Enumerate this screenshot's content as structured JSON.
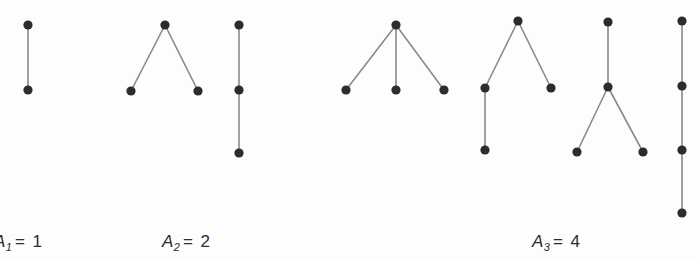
{
  "figure": {
    "background_color": "#fdfdfd",
    "node_color": "#2c2c2c",
    "edge_color": "#8a8a8a",
    "width": 698,
    "height": 259
  },
  "labels": [
    {
      "id": "label-a1",
      "variable": "A",
      "subscript": "1",
      "equals": "=",
      "value": "1",
      "text": "A1 = 1",
      "x": -6,
      "y": 232
    },
    {
      "id": "label-a2",
      "variable": "A",
      "subscript": "2",
      "equals": "=",
      "value": "2",
      "text": "A2 = 2",
      "x": 162,
      "y": 232
    },
    {
      "id": "label-a3",
      "variable": "A",
      "subscript": "3",
      "equals": "=",
      "value": "4",
      "text": "A3 = 4",
      "x": 532,
      "y": 232
    }
  ],
  "graphs": [
    {
      "id": "tree-1-path2",
      "group": "A1",
      "description": "path with 2 nodes",
      "node_count": 2,
      "nodes": [
        {
          "id": "n1",
          "x": 28,
          "y": 25
        },
        {
          "id": "n2",
          "x": 28,
          "y": 90
        }
      ],
      "edges": [
        [
          "n1",
          "n2"
        ]
      ]
    },
    {
      "id": "tree-2-cherry",
      "group": "A2",
      "description": "root with two leaf children",
      "node_count": 3,
      "nodes": [
        {
          "id": "n1",
          "x": 165,
          "y": 25
        },
        {
          "id": "n2",
          "x": 131,
          "y": 91
        },
        {
          "id": "n3",
          "x": 198,
          "y": 91
        }
      ],
      "edges": [
        [
          "n1",
          "n2"
        ],
        [
          "n1",
          "n3"
        ]
      ]
    },
    {
      "id": "tree-3-path3",
      "group": "A2",
      "description": "path with 3 nodes",
      "node_count": 3,
      "nodes": [
        {
          "id": "n1",
          "x": 239,
          "y": 25
        },
        {
          "id": "n2",
          "x": 239,
          "y": 90
        },
        {
          "id": "n3",
          "x": 239,
          "y": 153
        }
      ],
      "edges": [
        [
          "n1",
          "n2"
        ],
        [
          "n2",
          "n3"
        ]
      ]
    },
    {
      "id": "tree-4-star3",
      "group": "A3",
      "description": "root with three leaf children",
      "node_count": 4,
      "nodes": [
        {
          "id": "n1",
          "x": 396,
          "y": 25
        },
        {
          "id": "n2",
          "x": 346,
          "y": 90
        },
        {
          "id": "n3",
          "x": 396,
          "y": 90
        },
        {
          "id": "n4",
          "x": 444,
          "y": 90
        }
      ],
      "edges": [
        [
          "n1",
          "n2"
        ],
        [
          "n1",
          "n3"
        ],
        [
          "n1",
          "n4"
        ]
      ]
    },
    {
      "id": "tree-5-branch-left-deep",
      "group": "A3",
      "description": "root with two children, left child has one child",
      "node_count": 4,
      "nodes": [
        {
          "id": "n1",
          "x": 518,
          "y": 21
        },
        {
          "id": "n2",
          "x": 485,
          "y": 88
        },
        {
          "id": "n3",
          "x": 551,
          "y": 88
        },
        {
          "id": "n4",
          "x": 485,
          "y": 150
        }
      ],
      "edges": [
        [
          "n1",
          "n2"
        ],
        [
          "n1",
          "n3"
        ],
        [
          "n2",
          "n4"
        ]
      ]
    },
    {
      "id": "tree-6-stem-then-split",
      "group": "A3",
      "description": "root with one child that has two leaf children",
      "node_count": 4,
      "nodes": [
        {
          "id": "n1",
          "x": 608,
          "y": 22
        },
        {
          "id": "n2",
          "x": 608,
          "y": 87
        },
        {
          "id": "n3",
          "x": 577,
          "y": 152
        },
        {
          "id": "n4",
          "x": 643,
          "y": 152
        }
      ],
      "edges": [
        [
          "n1",
          "n2"
        ],
        [
          "n2",
          "n3"
        ],
        [
          "n2",
          "n4"
        ]
      ]
    },
    {
      "id": "tree-7-path4",
      "group": "A3",
      "description": "path with 4 nodes",
      "node_count": 4,
      "nodes": [
        {
          "id": "n1",
          "x": 682,
          "y": 21
        },
        {
          "id": "n2",
          "x": 682,
          "y": 86
        },
        {
          "id": "n3",
          "x": 682,
          "y": 150
        },
        {
          "id": "n4",
          "x": 682,
          "y": 213
        }
      ],
      "edges": [
        [
          "n1",
          "n2"
        ],
        [
          "n2",
          "n3"
        ],
        [
          "n3",
          "n4"
        ]
      ]
    }
  ],
  "node_radius": 4.6
}
